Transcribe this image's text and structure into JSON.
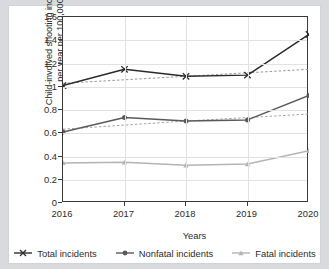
{
  "chart_data": {
    "type": "line",
    "title": "",
    "xlabel": "Years",
    "ylabel_line1": "Child-involved shooting incidents",
    "ylabel_line2": "per year per 100,000",
    "categories": [
      "2016",
      "2017",
      "2018",
      "2019",
      "2020"
    ],
    "x": [
      2016,
      2017,
      2018,
      2019,
      2020
    ],
    "xlim": [
      2016,
      2020
    ],
    "ylim": [
      0,
      1.6
    ],
    "ytick_labels": [
      "0",
      "0.2",
      "0.4",
      "0.6",
      "0.8",
      "1",
      "1.2",
      "1.4",
      "1.6"
    ],
    "ytick_values": [
      0,
      0.2,
      0.4,
      0.6,
      0.8,
      1.0,
      1.2,
      1.4,
      1.6
    ],
    "grid": true,
    "legend_position": "bottom",
    "series": [
      {
        "name": "Total incidents",
        "marker": "x",
        "color": "#2b2b2b",
        "values": [
          1.01,
          1.15,
          1.09,
          1.1,
          1.45
        ],
        "trend": {
          "dashed": true,
          "values": [
            1.03,
            1.06,
            1.09,
            1.12,
            1.15
          ],
          "color": "#8d8d8d"
        }
      },
      {
        "name": "Nonfatal incidents",
        "marker": "circle",
        "color": "#5a5a5a",
        "values": [
          0.61,
          0.735,
          0.705,
          0.715,
          0.925
        ],
        "trend": {
          "dashed": true,
          "values": [
            0.635,
            0.67,
            0.705,
            0.735,
            0.765
          ],
          "color": "#9a9a9a"
        }
      },
      {
        "name": "Fatal incidents",
        "marker": "triangle",
        "color": "#b4b4b4",
        "values": [
          0.345,
          0.35,
          0.325,
          0.335,
          0.45
        ],
        "trend": null
      }
    ]
  },
  "legend": {
    "items": [
      {
        "label": "Total incidents",
        "color": "#2b2b2b",
        "marker": "x"
      },
      {
        "label": "Nonfatal incidents",
        "color": "#5a5a5a",
        "marker": "circle"
      },
      {
        "label": "Fatal incidents",
        "color": "#b4b4b4",
        "marker": "triangle"
      }
    ]
  }
}
